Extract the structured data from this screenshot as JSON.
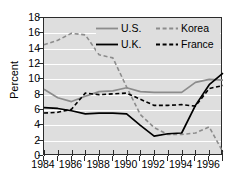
{
  "chart_data": {
    "type": "line",
    "title": "",
    "xlabel": "",
    "ylabel": "Percent",
    "xlim": [
      1984,
      1997
    ],
    "ylim": [
      0,
      18
    ],
    "ytick_labels": [
      "0",
      "2",
      "4",
      "6",
      "8",
      "10",
      "12",
      "14",
      "16",
      "18"
    ],
    "ytick_values": [
      0,
      2,
      4,
      6,
      8,
      10,
      12,
      14,
      16,
      18
    ],
    "xtick_labels": [
      "1984",
      "1986",
      "1988",
      "1990",
      "1992",
      "1994",
      "1996"
    ],
    "xtick_values": [
      1984,
      1986,
      1988,
      1990,
      1992,
      1994,
      1996
    ],
    "x": [
      1984,
      1985,
      1986,
      1987,
      1988,
      1989,
      1990,
      1991,
      1992,
      1993,
      1994,
      1995,
      1996,
      1997
    ],
    "grid": "horizontal",
    "legend_position": "top-right",
    "series": [
      {
        "name": "U.S.",
        "color": "#8c8c8c",
        "style": "solid",
        "values": [
          8.7,
          7.6,
          7.1,
          7.8,
          8.4,
          8.5,
          8.9,
          8.4,
          8.3,
          8.3,
          8.3,
          9.6,
          10.0,
          9.9
        ]
      },
      {
        "name": "Korea",
        "color": "#8c8c8c",
        "style": "dashed",
        "values": [
          14.5,
          15.1,
          16.0,
          15.8,
          13.2,
          12.8,
          9.0,
          5.4,
          3.7,
          2.8,
          2.8,
          3.0,
          3.8,
          0.5
        ]
      },
      {
        "name": "U.K.",
        "color": "#000000",
        "style": "solid",
        "values": [
          6.3,
          6.2,
          5.9,
          5.5,
          5.6,
          5.6,
          5.5,
          4.0,
          2.6,
          2.9,
          3.0,
          6.6,
          9.3,
          10.8
        ]
      },
      {
        "name": "France",
        "color": "#000000",
        "style": "dashed",
        "values": [
          5.6,
          5.7,
          6.1,
          8.2,
          8.0,
          8.1,
          8.2,
          7.4,
          6.6,
          6.6,
          6.7,
          6.5,
          8.8,
          9.2
        ]
      }
    ],
    "series_tail": [
      {
        "name": "U.S.",
        "values": [
          10.0,
          9.9,
          9.9
        ]
      },
      {
        "name": "U.K.",
        "values": [
          10.8,
          10.0,
          10.0
        ]
      },
      {
        "name": "France",
        "values": [
          9.2,
          9.0,
          8.9
        ]
      },
      {
        "name": "Korea",
        "values": [
          3.8,
          2.2,
          0.5
        ]
      }
    ]
  },
  "legend": {
    "entries": [
      {
        "label": "U.S.",
        "name": "legend-us"
      },
      {
        "label": "Korea",
        "name": "legend-korea"
      },
      {
        "label": "U.K.",
        "name": "legend-uk"
      },
      {
        "label": "France",
        "name": "legend-france"
      }
    ]
  },
  "axes": {
    "y_title": "Percent"
  }
}
